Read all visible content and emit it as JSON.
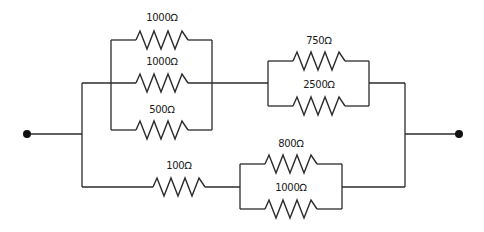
{
  "diagram": {
    "type": "resistor-network",
    "terminals": [
      {
        "id": "left",
        "x": 27,
        "y": 134
      },
      {
        "id": "right",
        "x": 459,
        "y": 134
      }
    ],
    "resistors": [
      {
        "id": "r1",
        "label": "1000Ω",
        "group": "top-parallel-block",
        "branch": "top"
      },
      {
        "id": "r2",
        "label": "1000Ω",
        "group": "top-parallel-block",
        "branch": "middle"
      },
      {
        "id": "r3",
        "label": "500Ω",
        "group": "top-parallel-block",
        "branch": "bottom"
      },
      {
        "id": "r4",
        "label": "750Ω",
        "group": "right-parallel-block",
        "branch": "top"
      },
      {
        "id": "r5",
        "label": "2500Ω",
        "group": "right-parallel-block",
        "branch": "bottom"
      },
      {
        "id": "r6",
        "label": "100Ω",
        "group": "bottom-branch",
        "branch": "series"
      },
      {
        "id": "r7",
        "label": "800Ω",
        "group": "bottom-parallel-block",
        "branch": "top"
      },
      {
        "id": "r8",
        "label": "1000Ω",
        "group": "bottom-parallel-block",
        "branch": "bottom"
      }
    ]
  }
}
